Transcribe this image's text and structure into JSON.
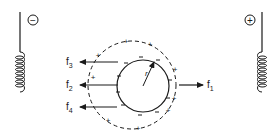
{
  "diagram": {
    "type": "physics-electrostatic-induction",
    "colors": {
      "ink": "#1a1a1a",
      "background": "#ffffff"
    },
    "left_electrode": {
      "sign": "−",
      "polarity": "negative"
    },
    "right_electrode": {
      "sign": "+",
      "polarity": "positive"
    },
    "particle": {
      "radius_label": "r",
      "surface_charges": "−",
      "cloud_charges": "+"
    },
    "forces": [
      {
        "id": "f1",
        "base": "f",
        "sub": "1",
        "direction": "right"
      },
      {
        "id": "f2",
        "base": "f",
        "sub": "2",
        "direction": "left"
      },
      {
        "id": "f3",
        "base": "f",
        "sub": "3",
        "direction": "left"
      },
      {
        "id": "f4",
        "base": "f",
        "sub": "4",
        "direction": "left"
      }
    ]
  }
}
